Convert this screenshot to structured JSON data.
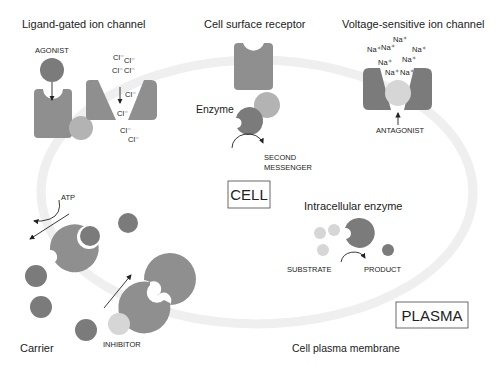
{
  "figure": {
    "sections": {
      "ligand_gated": {
        "title": "Ligand-gated ion channel",
        "agonist_label": "AGONIST",
        "ions": [
          "Cl⁻",
          "Cl⁻",
          "Cl⁻",
          "Cl⁻",
          "Cl⁻",
          "Cl⁻",
          "Cl⁻",
          "Cl⁻"
        ]
      },
      "cell_surface_receptor": {
        "title": "Cell surface receptor",
        "enzyme_label": "Enzyme",
        "second_messenger_line1": "SECOND",
        "second_messenger_line2": "MESSENGER"
      },
      "voltage_sensitive": {
        "title": "Voltage-sensitive ion channel",
        "ions": [
          "Na⁺",
          "Na⁺",
          "Na⁺",
          "Na⁺",
          "Na⁺",
          "Na⁺",
          "Na⁺",
          "Na⁺"
        ],
        "antagonist_label": "ANTAGONIST"
      },
      "intracellular_enzyme": {
        "title": "Intracellular enzyme",
        "substrate_label": "SUBSTRATE",
        "product_label": "PRODUCT"
      },
      "carrier": {
        "title": "Carrier",
        "atp_label": "ATP",
        "inhibitor_label": "INHIBITOR"
      }
    },
    "boxes": {
      "cell": "CELL",
      "plasma": "PLASMA"
    },
    "membrane_label": "Cell plasma membrane",
    "colors": {
      "membrane": "#efefef",
      "protein_dark": "#7b7b7b",
      "protein_mid": "#8f8f8f",
      "ligand_light": "#b3b3b3",
      "pale": "#d6d6d6"
    }
  }
}
